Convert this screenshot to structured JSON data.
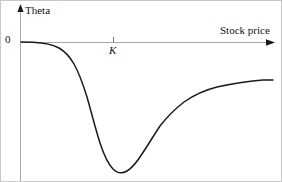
{
  "figure": {
    "background_color": "#ffffff",
    "border_color": "#c8c8c8",
    "width": 282,
    "height": 182
  },
  "axes": {
    "y_axis": {
      "label": "Theta",
      "color": "#a8a8a8",
      "arrowhead_color": "#1a1a1a",
      "x_position": 19,
      "top": 5,
      "bottom": 182
    },
    "x_axis": {
      "label": "Stock price",
      "color": "#a8a8a8",
      "arrowhead_color": "#1a1a1a",
      "y_position": 41,
      "left": 19,
      "right": 272
    },
    "origin_label": "0",
    "ticks": [
      {
        "label": "K",
        "x": 112,
        "italic": true
      }
    ]
  },
  "curve": {
    "color": "#1a1a1a",
    "width": 1.5,
    "path": "M 20 41 L 32 41.2 C 44 41.8 52 43.5 58 47 C 64 50.5 69 56 73 63 C 78 72 82 83 86 96 C 90 110 94 126 99 142 C 103 154 107 163 112 168 C 116 172 121 173 126 170 C 131 167 136 161 141 153 C 147 144 153 134 159 125 C 166 116 174 108 183 101 C 193 94 204 89 216 86 C 230 83 248 80 262 79 C 266 79 269 79 272 79"
  },
  "chart_data": {
    "type": "line",
    "title": "",
    "subtitle": "",
    "xlabel": "Stock price",
    "ylabel": "Theta",
    "xlim": [
      0,
      1
    ],
    "ylim": [
      -1,
      0.12
    ],
    "grid": false,
    "legend": false,
    "annotations": [
      {
        "text": "0",
        "role": "y-axis-origin-tick",
        "x": 0,
        "y": 0
      },
      {
        "text": "K",
        "role": "x-axis-strike-tick",
        "x": 0.368,
        "y": 0
      }
    ],
    "series": [
      {
        "name": "Theta",
        "x": [
          0.004,
          0.051,
          0.095,
          0.154,
          0.214,
          0.265,
          0.313,
          0.368,
          0.423,
          0.481,
          0.553,
          0.648,
          0.779,
          0.889,
          1.0
        ],
        "y": [
          0.0,
          0.0,
          -0.016,
          -0.106,
          -0.262,
          -0.434,
          -0.656,
          -0.884,
          -0.916,
          -0.797,
          -0.64,
          -0.457,
          -0.331,
          -0.277,
          -0.268
        ],
        "description": "Theta of an option as a function of the underlying stock price; near zero for deep out-of-the-money values, reaching a large negative minimum slightly above the strike K, then rising asymptotically toward a small negative value for deep in-the-money values."
      }
    ]
  }
}
